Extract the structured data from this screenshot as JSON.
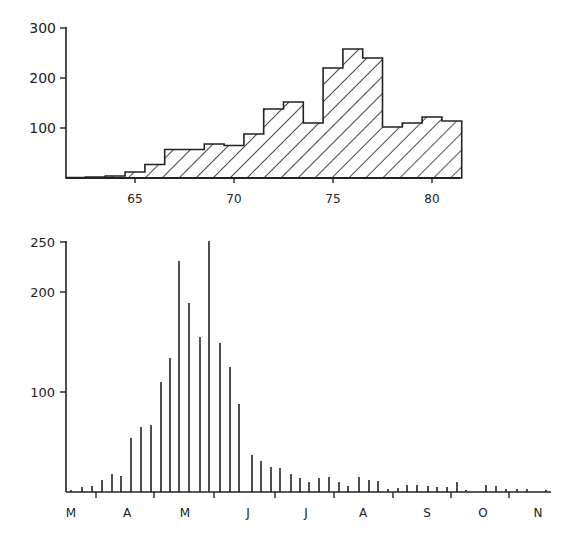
{
  "chart_data": [
    {
      "type": "bar",
      "subtype": "histogram-step-hatched",
      "title": "",
      "xlabel": "",
      "ylabel": "",
      "categories": [
        62,
        63,
        64,
        65,
        66,
        67,
        68,
        69,
        70,
        71,
        72,
        73,
        74,
        75,
        76,
        77,
        78,
        79,
        80,
        81
      ],
      "values": [
        1,
        2,
        4,
        12,
        27,
        57,
        57,
        68,
        65,
        88,
        138,
        152,
        110,
        220,
        258,
        240,
        102,
        110,
        122,
        114
      ],
      "ylim": [
        0,
        300
      ],
      "yticks": [
        100,
        200,
        300
      ],
      "xticks": [
        65,
        70,
        75,
        80
      ],
      "xlim": [
        61.5,
        81.5
      ],
      "grid": false,
      "legend": null,
      "fill": "diagonal-hatch",
      "color": "#222222"
    },
    {
      "type": "bar",
      "subtype": "spike-bars",
      "title": "",
      "xlabel": "",
      "ylabel": "",
      "x_month_labels": [
        "M",
        "A",
        "M",
        "J",
        "J",
        "A",
        "S",
        "O",
        "N"
      ],
      "ylim": [
        0,
        250
      ],
      "yticks": [
        100,
        200,
        250
      ],
      "grid": false,
      "legend": null,
      "color": "#222222",
      "bars": [
        {
          "x": 71,
          "v": 2
        },
        {
          "x": 82,
          "v": 5
        },
        {
          "x": 92,
          "v": 6
        },
        {
          "x": 102,
          "v": 12
        },
        {
          "x": 112,
          "v": 18
        },
        {
          "x": 121,
          "v": 16
        },
        {
          "x": 131,
          "v": 54
        },
        {
          "x": 141,
          "v": 65
        },
        {
          "x": 151,
          "v": 67
        },
        {
          "x": 161,
          "v": 110
        },
        {
          "x": 170,
          "v": 134
        },
        {
          "x": 179,
          "v": 231
        },
        {
          "x": 189,
          "v": 189
        },
        {
          "x": 200,
          "v": 155
        },
        {
          "x": 209,
          "v": 251
        },
        {
          "x": 220,
          "v": 149
        },
        {
          "x": 230,
          "v": 125
        },
        {
          "x": 239,
          "v": 88
        },
        {
          "x": 252,
          "v": 37
        },
        {
          "x": 261,
          "v": 31
        },
        {
          "x": 271,
          "v": 25
        },
        {
          "x": 280,
          "v": 24
        },
        {
          "x": 291,
          "v": 18
        },
        {
          "x": 300,
          "v": 14
        },
        {
          "x": 309,
          "v": 10
        },
        {
          "x": 319,
          "v": 14
        },
        {
          "x": 329,
          "v": 15
        },
        {
          "x": 339,
          "v": 10
        },
        {
          "x": 348,
          "v": 6
        },
        {
          "x": 359,
          "v": 15
        },
        {
          "x": 369,
          "v": 12
        },
        {
          "x": 378,
          "v": 11
        },
        {
          "x": 388,
          "v": 3
        },
        {
          "x": 398,
          "v": 4
        },
        {
          "x": 407,
          "v": 7
        },
        {
          "x": 417,
          "v": 7
        },
        {
          "x": 428,
          "v": 6
        },
        {
          "x": 437,
          "v": 5
        },
        {
          "x": 447,
          "v": 5
        },
        {
          "x": 457,
          "v": 10
        },
        {
          "x": 466,
          "v": 2
        },
        {
          "x": 486,
          "v": 7
        },
        {
          "x": 496,
          "v": 6
        },
        {
          "x": 506,
          "v": 3
        },
        {
          "x": 517,
          "v": 3
        },
        {
          "x": 527,
          "v": 3
        },
        {
          "x": 546,
          "v": 2
        }
      ]
    }
  ],
  "top_chart": {
    "y_tick_labels": [
      "300",
      "200",
      "100"
    ],
    "x_tick_labels": [
      "65",
      "70",
      "75",
      "80"
    ]
  },
  "bottom_chart": {
    "y_tick_labels": [
      "250",
      "200",
      "100"
    ],
    "month_labels": [
      "M",
      "A",
      "M",
      "J",
      "J",
      "A",
      "S",
      "O",
      "N"
    ]
  }
}
